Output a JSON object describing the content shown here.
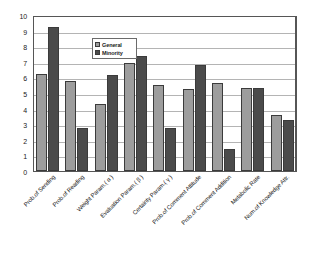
{
  "chart_data": {
    "type": "bar",
    "title": "",
    "xlabel": "",
    "ylabel": "",
    "ylim": [
      0,
      10
    ],
    "yticks": [
      0,
      1,
      2,
      3,
      4,
      5,
      6,
      7,
      8,
      9,
      10
    ],
    "grid": true,
    "legend_position": "upper-center-left",
    "categories": [
      "Prob.of Sending",
      "Prob.of Reading",
      "Weight Param.( α )",
      "Evaluation Param.( β )",
      "Certainty Param.( γ )",
      "Prob.of  Comment  Attitude",
      "Prob.of  Comment  Addition",
      "Metabolic  Rate",
      "Num.of  Knowledge  Attr."
    ],
    "series": [
      {
        "name": "General",
        "color": "#9d9d9d",
        "values": [
          6.25,
          5.75,
          4.3,
          6.9,
          5.5,
          5.25,
          5.65,
          5.35,
          3.6
        ]
      },
      {
        "name": "Minority",
        "color": "#4b4b4b",
        "values": [
          9.2,
          2.75,
          6.15,
          7.4,
          2.75,
          6.8,
          1.4,
          5.35,
          3.3
        ]
      }
    ]
  }
}
